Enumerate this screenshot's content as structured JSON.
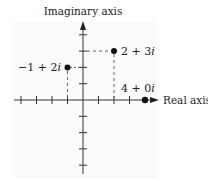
{
  "diagram": {
    "axes": {
      "imaginary_label": "Imaginary axis",
      "real_label": "Real axis",
      "real_ticks": [
        -4,
        -3,
        -2,
        -1,
        1,
        2,
        3
      ],
      "imaginary_ticks": [
        4,
        3,
        2,
        1,
        -1,
        -2,
        -3,
        -4
      ]
    },
    "points": [
      {
        "id": "p1",
        "re": 2,
        "im": 3,
        "label_main": "2 + 3",
        "label_i": "i"
      },
      {
        "id": "p2",
        "re": -1,
        "im": 2,
        "label_main": "−1 + 2",
        "label_i": "i"
      },
      {
        "id": "p3",
        "re": 4,
        "im": 0,
        "label_main": "4 + 0",
        "label_i": "i"
      }
    ],
    "colors": {
      "axis": "#333333",
      "point": "#111111",
      "dashed": "#555555",
      "background": "#ffffff"
    }
  }
}
